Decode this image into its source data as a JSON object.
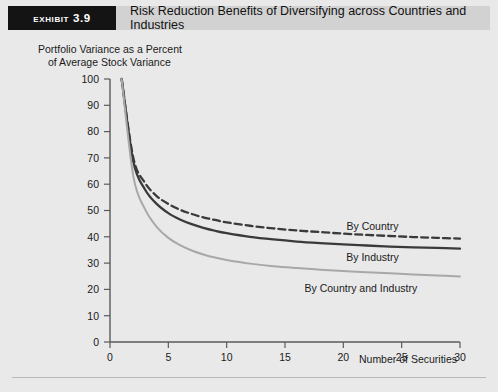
{
  "header": {
    "exhibit_tag": "Exhibit 3.9",
    "title": "Risk Reduction Benefits of Diversifying across Countries and Industries"
  },
  "colors": {
    "page_background": "#e9e9e9",
    "header_tag_bg": "#141414",
    "header_tag_text": "#ffffff",
    "header_title_bg": "#d2d2d2",
    "axis": "#5a5a5a",
    "by_country": "#3a3a3a",
    "by_industry": "#3a3a3a",
    "by_country_and_industry": "#a8a8a8"
  },
  "chart_data": {
    "type": "line",
    "title": "",
    "xlabel": "Number of Securities",
    "ylabel": "Portfolio Variance as a Percent of Average Stock Variance",
    "ylabel_line1": "Portfolio Variance as a Percent",
    "ylabel_line2": "of Average Stock Variance",
    "xlim": [
      0,
      30
    ],
    "ylim": [
      0,
      100
    ],
    "xticks": [
      0,
      5,
      10,
      15,
      20,
      25,
      30
    ],
    "yticks": [
      0,
      10,
      20,
      30,
      40,
      50,
      60,
      70,
      80,
      90,
      100
    ],
    "grid": false,
    "legend_position": "inline-annotations",
    "x": [
      1,
      2,
      3,
      4,
      5,
      6,
      7,
      8,
      9,
      10,
      12,
      14,
      16,
      18,
      20,
      22,
      24,
      26,
      28,
      30
    ],
    "series": [
      {
        "name": "By Country",
        "label": "By Country",
        "style": "dashed",
        "color": "#3a3a3a",
        "label_x": 22.5,
        "label_y": 44,
        "values": [
          100,
          70,
          60.5,
          55.5,
          52.5,
          50.3,
          48.7,
          47.4,
          46.4,
          45.5,
          44.2,
          43.2,
          42.4,
          41.8,
          41.2,
          40.7,
          40.3,
          39.9,
          39.6,
          39.3
        ]
      },
      {
        "name": "By Industry",
        "label": "By Industry",
        "style": "solid",
        "color": "#3a3a3a",
        "label_x": 22.5,
        "label_y": 32.5,
        "values": [
          100,
          68.5,
          58.0,
          52.5,
          49.0,
          46.6,
          44.8,
          43.4,
          42.3,
          41.4,
          40.0,
          39.0,
          38.2,
          37.6,
          37.1,
          36.7,
          36.3,
          36.0,
          35.8,
          35.5
        ]
      },
      {
        "name": "By Country and Industry",
        "label": "By Country and Industry",
        "style": "solid-light",
        "color": "#a8a8a8",
        "label_x": 21.5,
        "label_y": 20.5,
        "values": [
          100,
          63.0,
          50.5,
          43.8,
          39.6,
          36.8,
          34.8,
          33.3,
          32.1,
          31.2,
          29.8,
          28.8,
          28.1,
          27.5,
          27.0,
          26.5,
          26.1,
          25.7,
          25.3,
          24.9
        ]
      }
    ]
  }
}
